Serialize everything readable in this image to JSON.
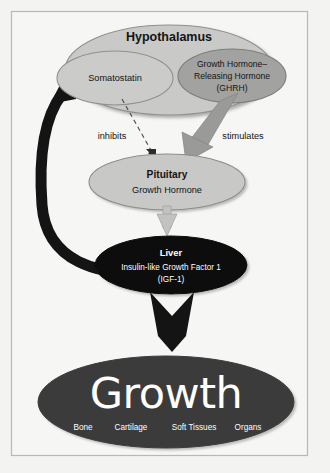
{
  "figure": {
    "background_color": "#f3f3f1",
    "frame_color": "#b8b8b4"
  },
  "nodes": {
    "hypothalamus": {
      "label": "Hypothalamus",
      "fill": "#c9c9c7",
      "stroke": "#8f8f8d"
    },
    "somatostatin": {
      "label": "Somatostatin",
      "fill": "#cbcbc9",
      "stroke": "#909090"
    },
    "ghrh": {
      "line1": "Growth Hormone–",
      "line2": "Releasing Hormone",
      "line3": "(GHRH)",
      "fill": "#a2a2a0",
      "stroke": "#7d7d7b"
    },
    "pituitary": {
      "title": "Pituitary",
      "subtitle": "Growth Hormone",
      "fill": "#c8c8c6",
      "stroke": "#8d8d8b"
    },
    "liver": {
      "title": "Liver",
      "line1": "Insulin-like Growth Factor 1",
      "line2": "(IGF-1)",
      "fill": "#0d0d0d",
      "stroke": "#0d0d0d"
    },
    "growth": {
      "title": "Growth",
      "tissues": [
        "Bone",
        "Cartilage",
        "Soft Tissues",
        "Organs"
      ],
      "fill": "#3a3a3a",
      "stroke": "#3a3a3a"
    }
  },
  "arrows": {
    "inhibits": {
      "label": "inhibits",
      "style": "dashed",
      "color": "#4a4a4a",
      "from": "somatostatin",
      "to": "pituitary"
    },
    "stimulates": {
      "label": "stimulates",
      "style": "solid-block",
      "color": "#9a9a98",
      "from": "ghrh",
      "to": "pituitary"
    },
    "pituitary_to_liver": {
      "label": "",
      "style": "solid-block",
      "color": "#c2c2c0",
      "from": "pituitary",
      "to": "liver"
    },
    "liver_to_growth": {
      "label": "",
      "style": "solid-block",
      "color": "#141414",
      "from": "liver",
      "to": "growth"
    },
    "feedback": {
      "label": "",
      "style": "curved-thick",
      "color": "#141414",
      "from": "liver",
      "to": "somatostatin"
    }
  }
}
